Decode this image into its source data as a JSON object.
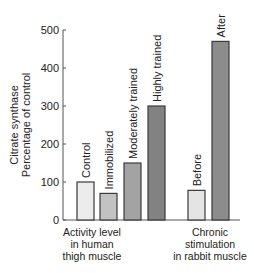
{
  "chart_data": {
    "type": "bar",
    "title": "",
    "ylabel": "Citrate synthase Percentage of control",
    "ylabel_lines": [
      "Citrate synthase",
      "Percentage of control"
    ],
    "xlabel": "",
    "ylim": [
      0,
      500
    ],
    "yticks": [
      0,
      100,
      200,
      300,
      400,
      500
    ],
    "grid": false,
    "legend": null,
    "groups": [
      {
        "label": "Activity level in human thigh muscle",
        "label_lines": [
          "Activity level",
          "in human",
          "thigh muscle"
        ],
        "categories": [
          "Control",
          "Immobilized",
          "Moderately trained",
          "Highly trained"
        ],
        "values": [
          100,
          70,
          150,
          300
        ],
        "colors": [
          "#ececec",
          "#c2c2c2",
          "#a3a3a3",
          "#828282"
        ]
      },
      {
        "label": "Chronic stimulation in rabbit muscle",
        "label_lines": [
          "Chronic",
          "stimulation",
          "in rabbit muscle"
        ],
        "categories": [
          "Before",
          "After"
        ],
        "values": [
          78,
          470
        ],
        "colors": [
          "#e4e4e4",
          "#8c8c8c"
        ]
      }
    ],
    "categories": [
      "Control",
      "Immobilized",
      "Moderately trained",
      "Highly trained",
      "Before",
      "After"
    ],
    "values": [
      100,
      70,
      150,
      300,
      78,
      470
    ]
  },
  "style": {
    "axis_color": "#555555",
    "bar_edge": "#3a3a3a",
    "text_color": "#222222"
  }
}
